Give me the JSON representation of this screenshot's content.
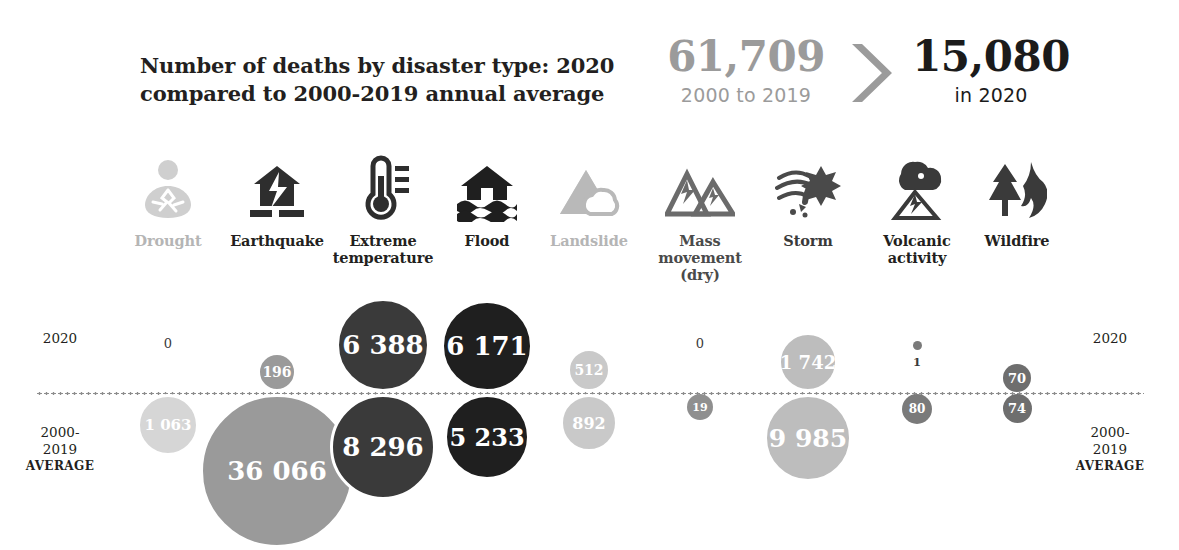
{
  "header": {
    "title_line1": "Number of deaths by disaster type: 2020",
    "title_line2": "compared to 2000-2019 annual average",
    "kpi_past_value": "61,709",
    "kpi_past_label": "2000 to 2019",
    "kpi_now_value": "15,080",
    "kpi_now_label": "in 2020",
    "arrow_icon": "chevron-right-icon"
  },
  "row_labels": {
    "top_left": "2020",
    "top_right": "2020",
    "bottom_left_line1": "2000-",
    "bottom_left_line2": "2019",
    "bottom_left_line3": "AVERAGE",
    "bottom_right_line1": "2000-",
    "bottom_right_line2": "2019",
    "bottom_right_line3": "AVERAGE"
  },
  "colors": {
    "drought": "#d6d6d6",
    "earthquake": "#9a9a9a",
    "extreme_temperature": "#3a3a3a",
    "flood": "#1f1f1f",
    "landslide": "#c9c9c9",
    "mass_movement": "#8f8f8f",
    "storm": "#bdbdbd",
    "volcanic_activity": "#7a7a7a",
    "wildfire": "#6e6e6e",
    "axis": "#8d8d8d",
    "text_dark": "#231f20",
    "text_muted": "#9b9b9b"
  },
  "chart_data": {
    "type": "bar",
    "title": "Number of deaths by disaster type: 2020 compared to 2000-2019 annual average",
    "xlabel": "",
    "ylabel": "Number of deaths",
    "categories": [
      "Drought",
      "Earthquake",
      "Extreme temperature",
      "Flood",
      "Landslide",
      "Mass movement (dry)",
      "Storm",
      "Volcanic activity",
      "Wildfire"
    ],
    "series": [
      {
        "name": "2020",
        "values": [
          0,
          196,
          6388,
          6171,
          512,
          0,
          1742,
          1,
          70
        ],
        "total": 15080
      },
      {
        "name": "2000-2019 AVERAGE",
        "values": [
          1063,
          36066,
          8296,
          5233,
          892,
          19,
          9985,
          80,
          74
        ],
        "total": 61709
      }
    ],
    "value_labels": {
      "2020": [
        "0",
        "196",
        "6 388",
        "6 171",
        "512",
        "0",
        "1 742",
        "1",
        "70"
      ],
      "average": [
        "1 063",
        "36 066",
        "8 296",
        "5 233",
        "892",
        "19",
        "9 985",
        "80",
        "74"
      ]
    },
    "legend_position": "left and right gutters",
    "grid": false
  },
  "columns": [
    {
      "key": "drought",
      "label_line1": "Drought",
      "label_line2": "",
      "label_line3": "",
      "icon": "drought-cracked-earth-icon",
      "icon_color": "#cfcfcf",
      "label_color": "#b5b5b5",
      "x": 168,
      "bubble_color": "#d6d6d6",
      "top": {
        "value": 0,
        "display": "0",
        "diameter": 0,
        "show_bubble": false,
        "label_outside": true,
        "font": 13
      },
      "bottom": {
        "value": 1063,
        "display": "1 063",
        "diameter": 62,
        "show_bubble": true,
        "label_outside": false,
        "font": 15
      }
    },
    {
      "key": "earthquake",
      "label_line1": "Earthquake",
      "label_line2": "",
      "label_line3": "",
      "icon": "earthquake-house-icon",
      "icon_color": "#2e2e2e",
      "label_color": "#231f20",
      "x": 277,
      "bubble_color": "#9a9a9a",
      "top": {
        "value": 196,
        "display": "196",
        "diameter": 40,
        "show_bubble": true,
        "label_outside": false,
        "font": 14
      },
      "bottom": {
        "value": 36066,
        "display": "36 066",
        "diameter": 154,
        "show_bubble": true,
        "label_outside": false,
        "font": 26
      }
    },
    {
      "key": "extreme_temperature",
      "label_line1": "Extreme",
      "label_line2": "temperature",
      "label_line3": "",
      "icon": "thermometer-icon",
      "icon_color": "#2e2e2e",
      "label_color": "#231f20",
      "x": 383,
      "bubble_color": "#3a3a3a",
      "top": {
        "value": 6388,
        "display": "6 388",
        "diameter": 94,
        "show_bubble": true,
        "label_outside": false,
        "font": 26
      },
      "bottom": {
        "value": 8296,
        "display": "8 296",
        "diameter": 106,
        "show_bubble": true,
        "label_outside": false,
        "font": 26
      }
    },
    {
      "key": "flood",
      "label_line1": "Flood",
      "label_line2": "",
      "label_line3": "",
      "icon": "flood-house-water-icon",
      "icon_color": "#1f1f1f",
      "label_color": "#231f20",
      "x": 487,
      "bubble_color": "#1f1f1f",
      "top": {
        "value": 6171,
        "display": "6 171",
        "diameter": 92,
        "show_bubble": true,
        "label_outside": false,
        "font": 26
      },
      "bottom": {
        "value": 5233,
        "display": "5 233",
        "diameter": 86,
        "show_bubble": true,
        "label_outside": false,
        "font": 24
      }
    },
    {
      "key": "landslide",
      "label_line1": "Landslide",
      "label_line2": "",
      "label_line3": "",
      "icon": "landslide-mountain-icon",
      "icon_color": "#b9b9b9",
      "label_color": "#b5b5b5",
      "x": 589,
      "bubble_color": "#c9c9c9",
      "top": {
        "value": 512,
        "display": "512",
        "diameter": 44,
        "show_bubble": true,
        "label_outside": false,
        "font": 14
      },
      "bottom": {
        "value": 892,
        "display": "892",
        "diameter": 58,
        "show_bubble": true,
        "label_outside": false,
        "font": 16
      }
    },
    {
      "key": "mass_movement",
      "label_line1": "Mass",
      "label_line2": "movement",
      "label_line3": "(dry)",
      "icon": "mass-movement-peaks-icon",
      "icon_color": "#6b6b6b",
      "label_color": "#4a4a4a",
      "x": 700,
      "bubble_color": "#8f8f8f",
      "top": {
        "value": 0,
        "display": "0",
        "diameter": 0,
        "show_bubble": false,
        "label_outside": true,
        "font": 13
      },
      "bottom": {
        "value": 19,
        "display": "19",
        "diameter": 26,
        "show_bubble": true,
        "label_outside": false,
        "font": 11
      }
    },
    {
      "key": "storm",
      "label_line1": "Storm",
      "label_line2": "",
      "label_line3": "",
      "icon": "storm-cyclone-icon",
      "icon_color": "#4a4a4a",
      "label_color": "#3a3a3a",
      "x": 808,
      "bubble_color": "#bdbdbd",
      "top": {
        "value": 1742,
        "display": "1 742",
        "diameter": 60,
        "show_bubble": true,
        "label_outside": false,
        "font": 18
      },
      "bottom": {
        "value": 9985,
        "display": "9 985",
        "diameter": 88,
        "show_bubble": true,
        "label_outside": false,
        "font": 25
      }
    },
    {
      "key": "volcanic_activity",
      "label_line1": "Volcanic",
      "label_line2": "activity",
      "label_line3": "",
      "icon": "volcano-eruption-icon",
      "icon_color": "#3a3a3a",
      "label_color": "#231f20",
      "x": 917,
      "bubble_color": "#7a7a7a",
      "top": {
        "value": 1,
        "display": "1",
        "diameter": 9,
        "show_bubble": true,
        "label_outside": true,
        "font": 10
      },
      "bottom": {
        "value": 80,
        "display": "80",
        "diameter": 30,
        "show_bubble": true,
        "label_outside": false,
        "font": 12
      }
    },
    {
      "key": "wildfire",
      "label_line1": "Wildfire",
      "label_line2": "",
      "label_line3": "",
      "icon": "wildfire-tree-flame-icon",
      "icon_color": "#3a3a3a",
      "label_color": "#231f20",
      "x": 1017,
      "bubble_color": "#6e6e6e",
      "top": {
        "value": 70,
        "display": "70",
        "diameter": 28,
        "show_bubble": true,
        "label_outside": false,
        "font": 13
      },
      "bottom": {
        "value": 74,
        "display": "74",
        "diameter": 29,
        "show_bubble": true,
        "label_outside": false,
        "font": 13
      }
    }
  ]
}
